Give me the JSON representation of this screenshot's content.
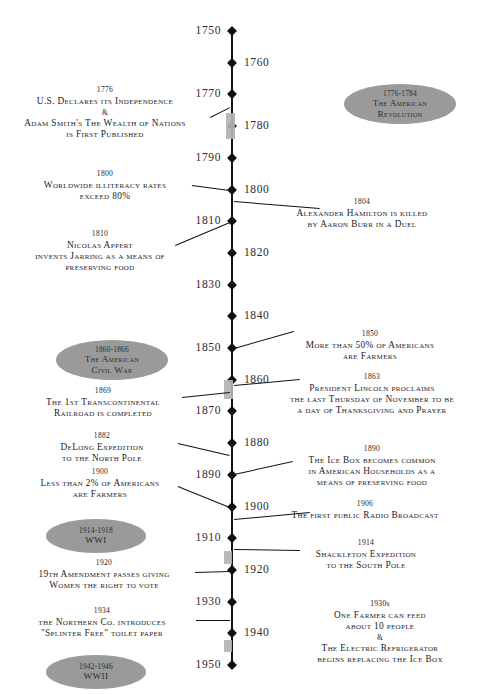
{
  "timeline": {
    "axis": {
      "start_year": 1750,
      "end_year": 1950,
      "step": 10
    },
    "ticks": [
      {
        "year": "1750",
        "side": "left"
      },
      {
        "year": "1760",
        "side": "right"
      },
      {
        "year": "1770",
        "side": "left"
      },
      {
        "year": "1780",
        "side": "right"
      },
      {
        "year": "1790",
        "side": "left"
      },
      {
        "year": "1800",
        "side": "right"
      },
      {
        "year": "1810",
        "side": "left"
      },
      {
        "year": "1820",
        "side": "right"
      },
      {
        "year": "1830",
        "side": "left"
      },
      {
        "year": "1840",
        "side": "right"
      },
      {
        "year": "1850",
        "side": "left"
      },
      {
        "year": "1860",
        "side": "right"
      },
      {
        "year": "1870",
        "side": "left"
      },
      {
        "year": "1880",
        "side": "right"
      },
      {
        "year": "1890",
        "side": "left"
      },
      {
        "year": "1900",
        "side": "right"
      },
      {
        "year": "1910",
        "side": "left"
      },
      {
        "year": "1920",
        "side": "right"
      },
      {
        "year": "1930",
        "side": "left"
      },
      {
        "year": "1940",
        "side": "right"
      },
      {
        "year": "1950",
        "side": "left"
      }
    ],
    "events": [
      {
        "id": "event-1776",
        "year": "1776",
        "side": "left",
        "lines": [
          "U.S. Declares its Independence",
          "&",
          "Adam Smith's The Wealth of Nations",
          "is First Published"
        ]
      },
      {
        "id": "event-1800",
        "year": "1800",
        "side": "left",
        "lines": [
          "Worldwide illiteracy rates",
          "exceed 80%"
        ]
      },
      {
        "id": "event-1804",
        "year": "1804",
        "side": "right",
        "lines": [
          "Alexander Hamilton is killed",
          "by Aaron Burr in a Duel"
        ]
      },
      {
        "id": "event-1810",
        "year": "1810",
        "side": "left",
        "lines": [
          "Nicolas Appert",
          "invents Jarring as a means of",
          "preserving food"
        ]
      },
      {
        "id": "event-1850",
        "year": "1850",
        "side": "right",
        "lines": [
          "More than 50% of Americans",
          "are Farmers"
        ]
      },
      {
        "id": "event-1863",
        "year": "1863",
        "side": "right",
        "lines": [
          "President Lincoln proclaims",
          "the last Thursday of November to be",
          "a day of Thanksgiving and Prayer"
        ]
      },
      {
        "id": "event-1869",
        "year": "1869",
        "side": "left",
        "lines": [
          "The 1st Transcontinental",
          "Railroad is completed"
        ]
      },
      {
        "id": "event-1882",
        "year": "1882",
        "side": "left",
        "lines": [
          "DeLong Expedition",
          "to the North Pole"
        ]
      },
      {
        "id": "event-1890",
        "year": "1890",
        "side": "right",
        "lines": [
          "The Ice Box becomes common",
          "in American Households as a",
          "means of preserving food"
        ]
      },
      {
        "id": "event-1900",
        "year": "1900",
        "side": "left",
        "lines": [
          "Less than 2% of Americans",
          "are Farmers"
        ]
      },
      {
        "id": "event-1906",
        "year": "1906",
        "side": "right",
        "lines": [
          "The first public Radio Broadcast"
        ]
      },
      {
        "id": "event-1914",
        "year": "1914",
        "side": "right",
        "lines": [
          "Shackleton Expedition",
          "to the South Pole"
        ]
      },
      {
        "id": "event-1920",
        "year": "1920",
        "side": "left",
        "lines": [
          "19th Amendment passes giving",
          "Women the right to vote"
        ]
      },
      {
        "id": "event-1934",
        "year": "1934",
        "side": "left",
        "lines": [
          "the Northern Co. introduces",
          "\"Splinter Free\" toilet paper"
        ]
      },
      {
        "id": "event-1930s",
        "year": "1930s",
        "side": "right",
        "lines": [
          "One Farmer can feed",
          "about 10 people",
          "&",
          "The Electric Refrigerator",
          "begins replacing the Ice Box"
        ]
      }
    ],
    "eras": [
      {
        "id": "era-american-revolution",
        "years": "1776-1784",
        "name_lines": [
          "The American",
          "Revolution"
        ],
        "side": "right"
      },
      {
        "id": "era-american-civil-war",
        "years": "1860-1866",
        "name_lines": [
          "The American",
          "Civil War"
        ],
        "side": "left"
      },
      {
        "id": "era-wwi",
        "years": "1914-1918",
        "name_lines": [
          "WWI"
        ],
        "side": "left"
      },
      {
        "id": "era-wwii",
        "years": "1942-1946",
        "name_lines": [
          "WWII"
        ],
        "side": "left"
      }
    ],
    "colors": {
      "axis": "#111114",
      "era_badge": "#9a9a9a",
      "era_bar": "#b3b3b3",
      "text": "#23232a",
      "background": "#ffffff"
    }
  }
}
